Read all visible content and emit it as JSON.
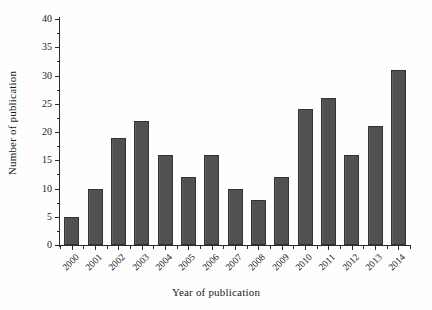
{
  "chart_data": {
    "type": "bar",
    "title": "",
    "xlabel": "Year of publication",
    "ylabel": "Number of publication",
    "categories": [
      "2000",
      "2001",
      "2002",
      "2003",
      "2004",
      "2005",
      "2006",
      "2007",
      "2008",
      "2009",
      "2010",
      "2011",
      "2012",
      "2013",
      "2014"
    ],
    "values": [
      5,
      10,
      19,
      22,
      16,
      12,
      16,
      10,
      8,
      12,
      24,
      26,
      16,
      21,
      31
    ],
    "ylim": [
      0,
      40
    ],
    "ytick_labels": [
      "0",
      "5",
      "10",
      "15",
      "20",
      "25",
      "30",
      "35",
      "40"
    ],
    "ytick_values": [
      0,
      5,
      10,
      15,
      20,
      25,
      30,
      35,
      40
    ],
    "ytick_step": 5,
    "grid": false,
    "legend": null,
    "legend_position": "none",
    "bar_color": "#565656",
    "bar_edge_color": "#333333",
    "axis_color": "#2b2b2b",
    "background_color": "#ffffff",
    "series": [
      {
        "name": "Number of publication",
        "values": [
          5,
          10,
          19,
          22,
          16,
          12,
          16,
          10,
          8,
          12,
          24,
          26,
          16,
          21,
          31
        ]
      }
    ]
  }
}
